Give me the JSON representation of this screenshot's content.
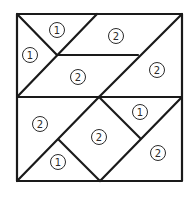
{
  "diagram": {
    "type": "dissected-square-puzzle",
    "stroke_color": "#1a1a1a",
    "background_color": "#ffffff",
    "outer_square": {
      "x1": 17,
      "y1": 14,
      "x2": 182,
      "y2": 181
    },
    "segments": [
      {
        "from": [
          17,
          97
        ],
        "to": [
          182,
          97
        ]
      },
      {
        "from": [
          17,
          14
        ],
        "to": [
          57,
          55
        ]
      },
      {
        "from": [
          97,
          14
        ],
        "to": [
          17,
          97
        ]
      },
      {
        "from": [
          57,
          55
        ],
        "to": [
          138,
          55
        ]
      },
      {
        "from": [
          182,
          14
        ],
        "to": [
          99,
          97
        ]
      },
      {
        "from": [
          99,
          97
        ],
        "to": [
          17,
          181
        ]
      },
      {
        "from": [
          99,
          97
        ],
        "to": [
          140,
          138
        ]
      },
      {
        "from": [
          59,
          140
        ],
        "to": [
          100,
          181
        ]
      },
      {
        "from": [
          182,
          97
        ],
        "to": [
          100,
          181
        ]
      }
    ],
    "regions": [
      {
        "name": "top-left-upper-triangle",
        "label": "1",
        "cx": 57,
        "cy": 30
      },
      {
        "name": "top-left-side-triangle",
        "label": "1",
        "cx": 30,
        "cy": 55
      },
      {
        "name": "top-middle-trapezoid",
        "label": "2",
        "cx": 116,
        "cy": 36
      },
      {
        "name": "center-left-parallelogram",
        "label": "2",
        "cx": 78,
        "cy": 77
      },
      {
        "name": "top-right-triangle",
        "label": "2",
        "cx": 157,
        "cy": 70
      },
      {
        "name": "bottom-left-triangle",
        "label": "2",
        "cx": 40,
        "cy": 124
      },
      {
        "name": "bottom-center-square",
        "label": "2",
        "cx": 99,
        "cy": 137
      },
      {
        "name": "bottom-right-upper-triangle",
        "label": "1",
        "cx": 140,
        "cy": 112
      },
      {
        "name": "bottom-small-triangle",
        "label": "1",
        "cx": 58,
        "cy": 162
      },
      {
        "name": "bottom-right-triangle",
        "label": "2",
        "cx": 158,
        "cy": 153
      }
    ]
  }
}
